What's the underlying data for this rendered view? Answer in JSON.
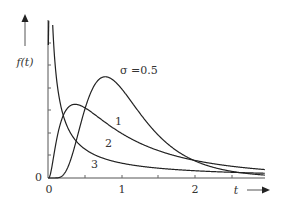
{
  "chart_data": {
    "type": "line",
    "title": "",
    "xlabel": "t",
    "ylabel": "f(t)",
    "xlim": [
      0,
      2.95
    ],
    "ylim": [
      0,
      1.41
    ],
    "grid": false,
    "legend": "inline curve labels",
    "x_ticks": [
      {
        "value": 0,
        "label": "0"
      },
      {
        "value": 0.5,
        "label": ""
      },
      {
        "value": 1,
        "label": "1"
      },
      {
        "value": 1.5,
        "label": ""
      },
      {
        "value": 2,
        "label": "2"
      },
      {
        "value": 2.5,
        "label": ""
      }
    ],
    "y_origin_label": "0",
    "series": [
      {
        "name": "σ =0.5",
        "sigma": 0.5,
        "mode_t": 0.78,
        "peak_f": 0.9,
        "x": [
          0.1,
          0.3,
          0.5,
          0.78,
          1.0,
          1.5,
          2.0,
          2.5,
          2.95
        ],
        "y": [
          0.0,
          0.2,
          0.75,
          0.9,
          0.8,
          0.41,
          0.15,
          0.05,
          0.02
        ]
      },
      {
        "name": "1",
        "sigma": 1,
        "mode_t": 0.37,
        "peak_f": 0.66,
        "x": [
          0.05,
          0.2,
          0.37,
          0.5,
          1.0,
          1.5,
          2.0,
          2.5,
          2.95
        ],
        "y": [
          0.06,
          0.55,
          0.66,
          0.63,
          0.4,
          0.24,
          0.16,
          0.11,
          0.08
        ]
      },
      {
        "name": "2",
        "sigma": 2,
        "mode_t": 0.02,
        "x": [
          0.05,
          0.1,
          0.2,
          0.5,
          1.0,
          1.5,
          2.0,
          2.5,
          2.95
        ],
        "y": [
          1.4,
          1.0,
          0.75,
          0.38,
          0.2,
          0.13,
          0.09,
          0.07,
          0.06
        ]
      },
      {
        "name": "3",
        "sigma": 3,
        "mode_t": 0.0001,
        "x": [
          0.03,
          0.1,
          0.2,
          0.5,
          1.0,
          1.5,
          2.0,
          2.5,
          2.95
        ],
        "y": [
          1.4,
          1.0,
          0.63,
          0.28,
          0.13,
          0.09,
          0.06,
          0.05,
          0.04
        ]
      }
    ]
  },
  "labels": {
    "y_axis": "f(t)",
    "x_axis": "t",
    "origin_y": "0",
    "origin_x": "0",
    "tick_1": "1",
    "tick_2": "2",
    "curve_05": "σ =0.5",
    "curve_1": "1",
    "curve_2": "2",
    "curve_3": "3"
  }
}
